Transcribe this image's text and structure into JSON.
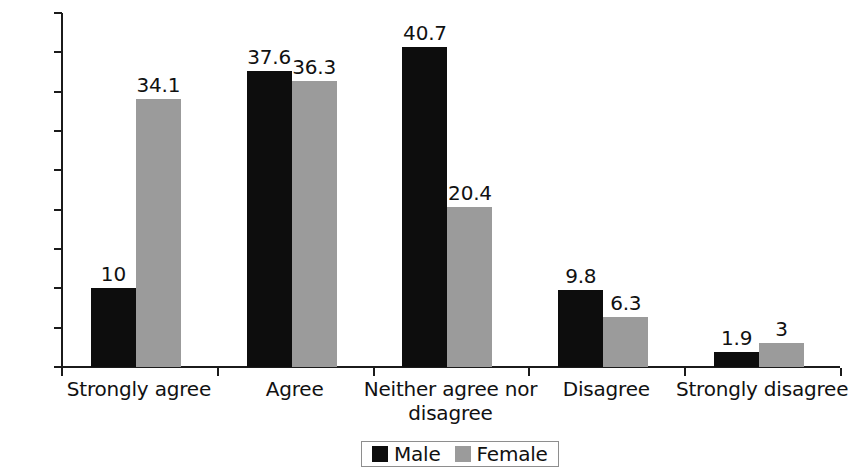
{
  "chart_data": {
    "type": "bar",
    "title": "",
    "subtitle": "",
    "xlabel": "",
    "ylabel": "",
    "grid": false,
    "legend_position": "bottom",
    "ylim": [
      0,
      45
    ],
    "ytick_labels": [
      "45%",
      "40%",
      "35%",
      "30%",
      "25%",
      "20%",
      "15%",
      "10%",
      "5%",
      "0%"
    ],
    "ytick_values": [
      45,
      40,
      35,
      30,
      25,
      20,
      15,
      10,
      5,
      0
    ],
    "categories": [
      "Strongly agree",
      "Agree",
      "Neither agree nor disagree",
      "Disagree",
      "Strongly disagree"
    ],
    "series": [
      {
        "name": "Male",
        "color": "#0d0d0d",
        "values": [
          10,
          37.6,
          40.7,
          9.8,
          1.9
        ],
        "labels": [
          "10",
          "37.6",
          "40.7",
          "9.8",
          "1.9"
        ]
      },
      {
        "name": "Female",
        "color": "#9b9b9b",
        "values": [
          34.1,
          36.3,
          20.4,
          6.3,
          3
        ],
        "labels": [
          "34.1",
          "36.3",
          "20.4",
          "6.3",
          "3"
        ]
      }
    ]
  },
  "legend": {
    "entries": [
      {
        "label": "Male",
        "color": "#0d0d0d"
      },
      {
        "label": "Female",
        "color": "#9b9b9b"
      }
    ]
  }
}
